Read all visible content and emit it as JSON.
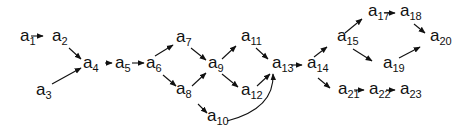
{
  "diagram": {
    "type": "directed-graph",
    "ink_color": "#111111",
    "background": "#ffffff",
    "nodes": [
      {
        "id": "a1",
        "letter": "a",
        "sub": "1",
        "x": 20,
        "y": 41
      },
      {
        "id": "a2",
        "letter": "a",
        "sub": "2",
        "x": 52,
        "y": 41
      },
      {
        "id": "a3",
        "letter": "a",
        "sub": "3",
        "x": 36,
        "y": 95
      },
      {
        "id": "a4",
        "letter": "a",
        "sub": "4",
        "x": 83,
        "y": 68
      },
      {
        "id": "a5",
        "letter": "a",
        "sub": "5",
        "x": 115,
        "y": 68
      },
      {
        "id": "a6",
        "letter": "a",
        "sub": "6",
        "x": 146,
        "y": 68
      },
      {
        "id": "a7",
        "letter": "a",
        "sub": "7",
        "x": 176,
        "y": 42
      },
      {
        "id": "a8",
        "letter": "a",
        "sub": "8",
        "x": 176,
        "y": 94
      },
      {
        "id": "a9",
        "letter": "a",
        "sub": "9",
        "x": 208,
        "y": 68
      },
      {
        "id": "a10",
        "letter": "a",
        "sub": "10",
        "x": 207,
        "y": 121
      },
      {
        "id": "a11",
        "letter": "a",
        "sub": "11",
        "x": 241,
        "y": 41
      },
      {
        "id": "a12",
        "letter": "a",
        "sub": "12",
        "x": 241,
        "y": 95
      },
      {
        "id": "a13",
        "letter": "a",
        "sub": "13",
        "x": 272,
        "y": 68
      },
      {
        "id": "a14",
        "letter": "a",
        "sub": "14",
        "x": 307,
        "y": 68
      },
      {
        "id": "a15",
        "letter": "a",
        "sub": "15",
        "x": 337,
        "y": 41
      },
      {
        "id": "a17",
        "letter": "a",
        "sub": "17",
        "x": 368,
        "y": 16
      },
      {
        "id": "a18",
        "letter": "a",
        "sub": "18",
        "x": 400,
        "y": 16
      },
      {
        "id": "a19",
        "letter": "a",
        "sub": "19",
        "x": 383,
        "y": 68
      },
      {
        "id": "a20",
        "letter": "a",
        "sub": "20",
        "x": 430,
        "y": 41
      },
      {
        "id": "a21",
        "letter": "a",
        "sub": "21",
        "x": 338,
        "y": 94
      },
      {
        "id": "a22",
        "letter": "a",
        "sub": "22",
        "x": 369,
        "y": 94
      },
      {
        "id": "a23",
        "letter": "a",
        "sub": "23",
        "x": 400,
        "y": 94
      }
    ],
    "edges": [
      {
        "from": "a1",
        "to": "a2",
        "curve": false,
        "path": [
          31,
          36,
          43,
          36
        ]
      },
      {
        "from": "a2",
        "to": "a4",
        "curve": false,
        "path": [
          69,
          48,
          81,
          59
        ]
      },
      {
        "from": "a3",
        "to": "a4",
        "curve": false,
        "path": [
          52,
          84,
          81,
          68
        ]
      },
      {
        "from": "a4",
        "to": "a5",
        "curve": false,
        "path": [
          105,
          63,
          112,
          63
        ]
      },
      {
        "from": "a5",
        "to": "a6",
        "curve": false,
        "path": [
          132,
          63,
          144,
          63
        ]
      },
      {
        "from": "a6",
        "to": "a7",
        "curve": false,
        "path": [
          155,
          56,
          173,
          45
        ]
      },
      {
        "from": "a6",
        "to": "a8",
        "curve": false,
        "path": [
          163,
          75,
          176,
          86
        ]
      },
      {
        "from": "a7",
        "to": "a9",
        "curve": false,
        "path": [
          191,
          48,
          206,
          60
        ]
      },
      {
        "from": "a8",
        "to": "a9",
        "curve": false,
        "path": [
          192,
          86,
          206,
          73
        ]
      },
      {
        "from": "a8",
        "to": "a10",
        "curve": false,
        "path": [
          198,
          104,
          207,
          113
        ]
      },
      {
        "from": "a9",
        "to": "a11",
        "curve": false,
        "path": [
          222,
          59,
          236,
          46
        ]
      },
      {
        "from": "a9",
        "to": "a12",
        "curve": false,
        "path": [
          222,
          74,
          238,
          87
        ]
      },
      {
        "from": "a11",
        "to": "a13",
        "curve": false,
        "path": [
          256,
          48,
          268,
          59
        ]
      },
      {
        "from": "a12",
        "to": "a13",
        "curve": false,
        "path": [
          257,
          86,
          270,
          74
        ]
      },
      {
        "from": "a10",
        "to": "a13",
        "curve": true,
        "path": [
          227,
          121,
          262,
          112,
          274,
          95,
          273,
          74
        ]
      },
      {
        "from": "a13",
        "to": "a14",
        "curve": false,
        "path": [
          291,
          65,
          302,
          65
        ]
      },
      {
        "from": "a14",
        "to": "a15",
        "curve": false,
        "path": [
          314,
          57,
          327,
          47
        ]
      },
      {
        "from": "a14",
        "to": "a21",
        "curve": false,
        "path": [
          318,
          78,
          330,
          88
        ]
      },
      {
        "from": "a15",
        "to": "a17",
        "curve": false,
        "path": [
          345,
          33,
          362,
          19
        ]
      },
      {
        "from": "a15",
        "to": "a19",
        "curve": false,
        "path": [
          353,
          49,
          372,
          61
        ]
      },
      {
        "from": "a17",
        "to": "a18",
        "curve": false,
        "path": [
          384,
          13,
          395,
          13
        ]
      },
      {
        "from": "a18",
        "to": "a20",
        "curve": false,
        "path": [
          414,
          24,
          425,
          33
        ]
      },
      {
        "from": "a19",
        "to": "a20",
        "curve": false,
        "path": [
          399,
          58,
          420,
          47
        ]
      },
      {
        "from": "a21",
        "to": "a22",
        "curve": false,
        "path": [
          354,
          90,
          364,
          90
        ]
      },
      {
        "from": "a22",
        "to": "a23",
        "curve": false,
        "path": [
          386,
          90,
          395,
          90
        ]
      }
    ]
  }
}
